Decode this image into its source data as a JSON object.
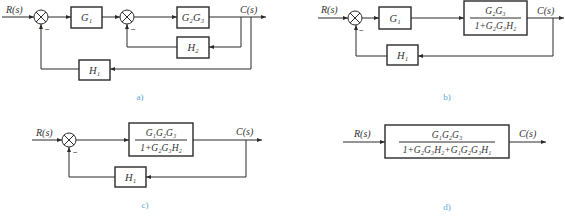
{
  "diagrams": {
    "a": {
      "caption": "a)",
      "input": "R(s)",
      "output": "C(s)",
      "blocks": {
        "g1": "G₁",
        "g2g3": "G₂G₃",
        "h2": "H₂",
        "h1": "H₁"
      },
      "signs": {
        "sum1_feedback": "−",
        "sum2_feedback": "−"
      }
    },
    "b": {
      "caption": "b)",
      "input": "R(s)",
      "output": "C(s)",
      "blocks": {
        "g1": "G₁",
        "inner_num": "G₂G₃",
        "inner_den": "1+G₂G₃H₂",
        "h1": "H₁"
      },
      "signs": {
        "sum_feedback": "−"
      }
    },
    "c": {
      "caption": "c)",
      "input": "R(s)",
      "output": "C(s)",
      "blocks": {
        "fwd_num": "G₁G₂G₃",
        "fwd_den": "1+G₂G₃H₂",
        "h1": "H₁"
      },
      "signs": {
        "sum_feedback": "−"
      }
    },
    "d": {
      "caption": "d)",
      "input": "R(s)",
      "output": "C(s)",
      "blocks": {
        "tf_num": "G₁G₂G₃",
        "tf_den": "1+G₂G₃H₂+G₁G₂G₃H₁"
      }
    }
  },
  "colors": {
    "line": "#2a2a2a",
    "caption": "#5aa8d8"
  }
}
